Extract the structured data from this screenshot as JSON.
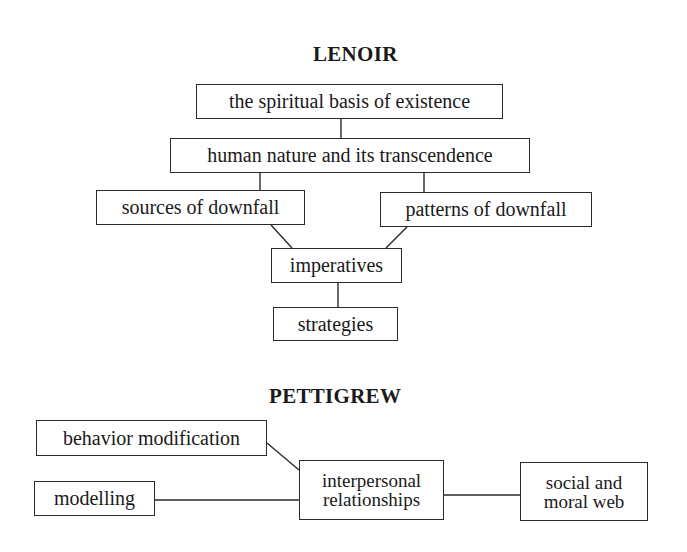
{
  "diagrams": {
    "lenoir": {
      "title": "LENOIR",
      "nodes": {
        "spiritual_basis": "the spiritual basis of existence",
        "human_nature": "human nature and its transcendence",
        "sources_of_downfall": "sources of downfall",
        "patterns_of_downfall": "patterns of downfall",
        "imperatives": "imperatives",
        "strategies": "strategies"
      },
      "edges": [
        [
          "the spiritual basis of existence",
          "human nature and its transcendence"
        ],
        [
          "human nature and its transcendence",
          "sources of downfall"
        ],
        [
          "human nature and its transcendence",
          "patterns of downfall"
        ],
        [
          "sources of downfall",
          "imperatives"
        ],
        [
          "patterns of downfall",
          "imperatives"
        ],
        [
          "imperatives",
          "strategies"
        ]
      ]
    },
    "pettigrew": {
      "title": "PETTIGREW",
      "nodes": {
        "behavior_modification": "behavior modification",
        "modelling": "modelling",
        "interpersonal_line1": "interpersonal",
        "interpersonal_line2": "relationships",
        "social_line1": "social and",
        "social_line2": "moral web"
      },
      "edges": [
        [
          "behavior modification",
          "interpersonal relationships"
        ],
        [
          "modelling",
          "interpersonal relationships"
        ],
        [
          "interpersonal relationships",
          "social and moral web"
        ]
      ]
    }
  }
}
